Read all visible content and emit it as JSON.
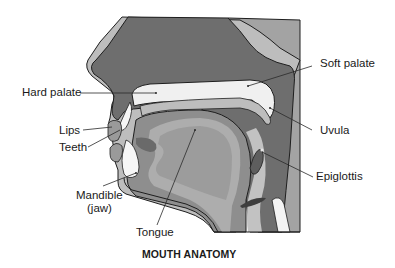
{
  "title": "MOUTH ANATOMY",
  "labels": {
    "hard_palate": "Hard palate",
    "soft_palate": "Soft palate",
    "lips": "Lips",
    "teeth": "Teeth",
    "uvula": "Uvula",
    "epiglottis": "Epiglottis",
    "mandible_line1": "Mandible",
    "mandible_line2": "(jaw)",
    "tongue": "Tongue"
  },
  "colors": {
    "dark_tissue": "#6e6e6e",
    "mid_tissue": "#9a9a9a",
    "light_tissue": "#bcbcbc",
    "pale": "#f2f2f2",
    "outline": "#1e1e1e"
  }
}
